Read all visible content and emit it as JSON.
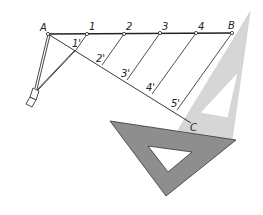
{
  "diagram": {
    "points": {
      "A": {
        "label": "A",
        "x": 48,
        "y": 34
      },
      "B": {
        "label": "B",
        "x": 232,
        "y": 33
      },
      "C": {
        "label": "C",
        "x": 191,
        "y": 123
      }
    },
    "divisions_on_AB": [
      {
        "label": "1",
        "x": 87,
        "y": 34
      },
      {
        "label": "2",
        "x": 124,
        "y": 34
      },
      {
        "label": "3",
        "x": 160,
        "y": 33
      },
      {
        "label": "4",
        "x": 196,
        "y": 33
      }
    ],
    "divisions_on_AC": [
      {
        "label": "1'",
        "x": 76,
        "y": 50
      },
      {
        "label": "2'",
        "x": 102,
        "y": 65
      },
      {
        "label": "3'",
        "x": 127,
        "y": 80
      },
      {
        "label": "4'",
        "x": 152,
        "y": 94
      },
      {
        "label": "5'",
        "x": 177,
        "y": 110
      }
    ],
    "tools": {
      "compass": "compass",
      "light_set_square": "30-60 set square",
      "dark_set_square": "45 set square"
    },
    "colors": {
      "line": "#222222",
      "light_triangle": "#d6d6d6",
      "dark_triangle": "#8e8e8e"
    }
  }
}
